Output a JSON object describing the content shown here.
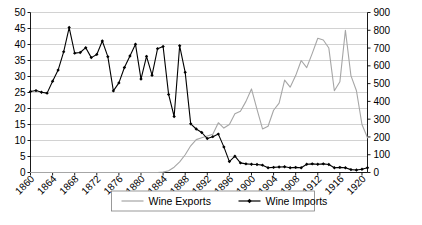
{
  "chart_data": {
    "type": "line",
    "title": "",
    "subtitle": "",
    "xlabel": "",
    "ylabel": "",
    "y2label": "",
    "grid": true,
    "legend_position": "bottom",
    "x": [
      1860,
      1861,
      1862,
      1863,
      1864,
      1865,
      1866,
      1867,
      1868,
      1869,
      1870,
      1871,
      1872,
      1873,
      1874,
      1875,
      1876,
      1877,
      1878,
      1879,
      1880,
      1881,
      1882,
      1883,
      1884,
      1885,
      1886,
      1887,
      1888,
      1889,
      1890,
      1891,
      1892,
      1893,
      1894,
      1895,
      1896,
      1897,
      1898,
      1899,
      1900,
      1901,
      1902,
      1903,
      1904,
      1905,
      1906,
      1907,
      1908,
      1909,
      1910,
      1911,
      1912,
      1913,
      1914,
      1915,
      1916,
      1917,
      1918,
      1919,
      1920,
      1921
    ],
    "xticks": [
      1860,
      1864,
      1868,
      1872,
      1876,
      1880,
      1884,
      1888,
      1892,
      1896,
      1900,
      1904,
      1908,
      1912,
      1916,
      1920
    ],
    "xtick_labels": [
      "1860",
      "1864",
      "1868",
      "1872",
      "1876",
      "1880",
      "1884",
      "1888",
      "1892",
      "1896",
      "1900",
      "1904",
      "1908",
      "1912",
      "1916",
      "1920"
    ],
    "ylim": [
      0,
      50
    ],
    "yticks": [
      0,
      5,
      10,
      15,
      20,
      25,
      30,
      35,
      40,
      45,
      50
    ],
    "ytick_labels": [
      "0",
      "5",
      "10",
      "15",
      "20",
      "25",
      "30",
      "35",
      "40",
      "45",
      "50"
    ],
    "y2lim": [
      0,
      900
    ],
    "y2ticks": [
      0,
      100,
      200,
      300,
      400,
      500,
      600,
      700,
      800,
      900
    ],
    "y2tick_labels": [
      "0",
      "100",
      "200",
      "300",
      "400",
      "500",
      "600",
      "700",
      "800",
      "900"
    ],
    "series": [
      {
        "name": "Wine Exports",
        "axis": "right",
        "color": "#a6a6a6",
        "marker": "none",
        "values": [
          0,
          0,
          0,
          0,
          0,
          0,
          0,
          0,
          0,
          0,
          0,
          0,
          0,
          0,
          0,
          0,
          0,
          0,
          0,
          0,
          0,
          0,
          0,
          0,
          2,
          10,
          30,
          60,
          100,
          150,
          185,
          195,
          205,
          215,
          280,
          250,
          270,
          330,
          345,
          400,
          470,
          355,
          245,
          260,
          350,
          390,
          520,
          480,
          545,
          630,
          590,
          670,
          755,
          745,
          700,
          460,
          510,
          800,
          545,
          460,
          270,
          195
        ]
      },
      {
        "name": "Wine Imports",
        "axis": "left",
        "color": "#000000",
        "marker": "diamond",
        "values": [
          25.3,
          25.6,
          25.1,
          24.8,
          28.5,
          32.0,
          37.7,
          45.3,
          37.3,
          37.5,
          39.0,
          35.9,
          36.9,
          41.1,
          36.2,
          25.5,
          28.0,
          32.8,
          36.4,
          40.1,
          29.2,
          36.3,
          30.4,
          38.7,
          39.4,
          24.4,
          17.5,
          39.6,
          31.3,
          15.2,
          13.6,
          12.5,
          10.6,
          11.2,
          12.0,
          8.0,
          3.4,
          5.1,
          3.0,
          2.7,
          2.6,
          2.5,
          2.3,
          1.5,
          1.6,
          1.7,
          1.8,
          1.5,
          1.6,
          1.5,
          2.6,
          2.7,
          2.6,
          2.7,
          2.5,
          1.5,
          1.6,
          1.5,
          0.9,
          0.8,
          1.0,
          1.5
        ]
      }
    ]
  },
  "legend": {
    "items": [
      {
        "label": "Wine Exports",
        "marker": "line"
      },
      {
        "label": "Wine Imports",
        "marker": "line-diamond"
      }
    ]
  },
  "colors": {
    "exports": "#a6a6a6",
    "imports": "#000000",
    "grid": "#bfbfbf",
    "axis": "#000000",
    "background": "#ffffff"
  }
}
